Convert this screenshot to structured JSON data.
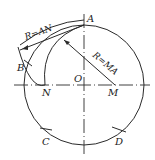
{
  "diagram": {
    "title": "",
    "circle": {
      "center_label": "O",
      "cx": 84,
      "cy": 85,
      "r": 60
    },
    "points": {
      "A": {
        "label": "A",
        "x": 84,
        "y": 25
      },
      "B": {
        "label": "B",
        "x": 27,
        "y": 63
      },
      "N": {
        "label": "N",
        "x": 45,
        "y": 85
      },
      "M": {
        "label": "M",
        "x": 115,
        "y": 85
      },
      "O": {
        "label": "O",
        "x": 84,
        "y": 85
      },
      "C": {
        "label": "C",
        "x": 47,
        "y": 134
      },
      "D": {
        "label": "D",
        "x": 119,
        "y": 133
      }
    },
    "annotations": {
      "radius_AN": "R=AN",
      "radius_MA": "R=MA"
    },
    "colors": {
      "line": "#2a2a2a",
      "background": "#ffffff"
    }
  }
}
